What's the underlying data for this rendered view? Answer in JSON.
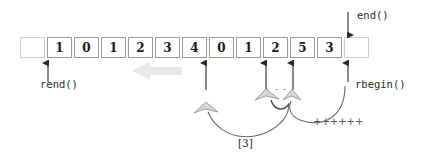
{
  "figure": {
    "colors": {
      "cell_border": "#9a9a9a",
      "empty_cell_border": "#cfcfcf",
      "arrow": "#2b2b2b",
      "curve": "#6b6b6b",
      "gray_arrow_fill": "#d6d6d6",
      "gray_arrow_stroke": "#9a9a9a",
      "big_gray_arrow": "#e8e8e8",
      "text": "#2b2b2b"
    }
  },
  "array": {
    "name": "sequence-cells",
    "cells": [
      {
        "value": "",
        "empty": true
      },
      {
        "value": "1",
        "empty": false
      },
      {
        "value": "0",
        "empty": false
      },
      {
        "value": "1",
        "empty": false
      },
      {
        "value": "2",
        "empty": false
      },
      {
        "value": "3",
        "empty": false
      },
      {
        "value": "4",
        "empty": false
      },
      {
        "value": "0",
        "empty": false
      },
      {
        "value": "1",
        "empty": false
      },
      {
        "value": "2",
        "empty": false
      },
      {
        "value": "5",
        "empty": false
      },
      {
        "value": "3",
        "empty": false
      },
      {
        "value": "",
        "empty": true
      }
    ]
  },
  "labels": {
    "rend": "rend()",
    "end": "end()",
    "rbegin": "rbegin()",
    "index": "[3]",
    "increment": "++++++",
    "decrement": "- -"
  },
  "markers": {
    "rend_arrow": {
      "name": "rend-pointer-arrow",
      "x": 48,
      "direction": "up"
    },
    "mid_arrow": {
      "name": "element-4-arrow",
      "x": 206,
      "direction": "up"
    },
    "left_arrow": {
      "name": "element-2-arrow",
      "x": 266,
      "direction": "up"
    },
    "right_arrow": {
      "name": "element-5-arrow",
      "x": 293,
      "direction": "up"
    },
    "rbegin_arrow": {
      "name": "rbegin-pointer-arrow",
      "x": 348,
      "direction": "up"
    },
    "end_arrow": {
      "name": "end-pointer-arrow",
      "x": 348,
      "direction": "down"
    },
    "big_gray_arrow": {
      "name": "traversal-direction-arrow",
      "direction": "left"
    }
  }
}
